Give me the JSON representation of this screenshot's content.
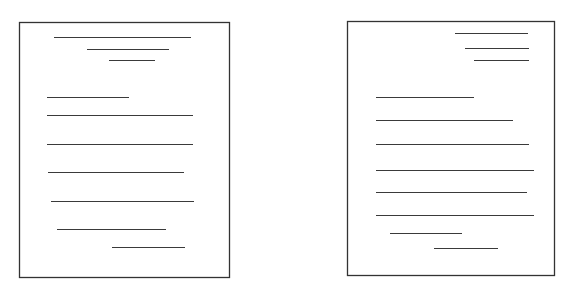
{
  "colors": {
    "background": "#ffffff",
    "stroke": "#333333",
    "line": "#3a3a3a"
  },
  "pages": [
    {
      "name": "centered-heading-layout",
      "box": {
        "x": 19,
        "y": 22,
        "w": 210,
        "h": 255
      },
      "lines": [
        {
          "x1": 54,
          "x2": 191,
          "y": 37
        },
        {
          "x1": 87,
          "x2": 169,
          "y": 49
        },
        {
          "x1": 109,
          "x2": 155,
          "y": 60
        },
        {
          "x1": 47,
          "x2": 129,
          "y": 97
        },
        {
          "x1": 47,
          "x2": 193,
          "y": 115
        },
        {
          "x1": 47,
          "x2": 193,
          "y": 144
        },
        {
          "x1": 48,
          "x2": 184,
          "y": 172
        },
        {
          "x1": 51,
          "x2": 194,
          "y": 201
        },
        {
          "x1": 57,
          "x2": 166,
          "y": 229
        },
        {
          "x1": 112,
          "x2": 185,
          "y": 247
        }
      ]
    },
    {
      "name": "right-aligned-heading-layout",
      "box": {
        "x": 347,
        "y": 21,
        "w": 207,
        "h": 254
      },
      "lines": [
        {
          "x1": 455,
          "x2": 528,
          "y": 33
        },
        {
          "x1": 465,
          "x2": 529,
          "y": 48
        },
        {
          "x1": 474,
          "x2": 529,
          "y": 60
        },
        {
          "x1": 376,
          "x2": 474,
          "y": 97
        },
        {
          "x1": 376,
          "x2": 513,
          "y": 120
        },
        {
          "x1": 376,
          "x2": 529,
          "y": 144
        },
        {
          "x1": 376,
          "x2": 534,
          "y": 170
        },
        {
          "x1": 376,
          "x2": 527,
          "y": 192
        },
        {
          "x1": 376,
          "x2": 534,
          "y": 215
        },
        {
          "x1": 390,
          "x2": 462,
          "y": 233
        },
        {
          "x1": 434,
          "x2": 498,
          "y": 248
        }
      ]
    }
  ]
}
